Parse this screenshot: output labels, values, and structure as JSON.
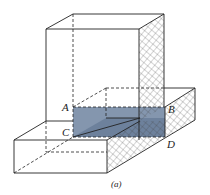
{
  "figure": {
    "caption": "(a)",
    "labels": {
      "A": "A",
      "B": "B",
      "C": "C",
      "D": "D"
    },
    "colors": {
      "shaded_plane": "#6f84a0",
      "lines": "#222222",
      "background": "#ffffff"
    }
  }
}
